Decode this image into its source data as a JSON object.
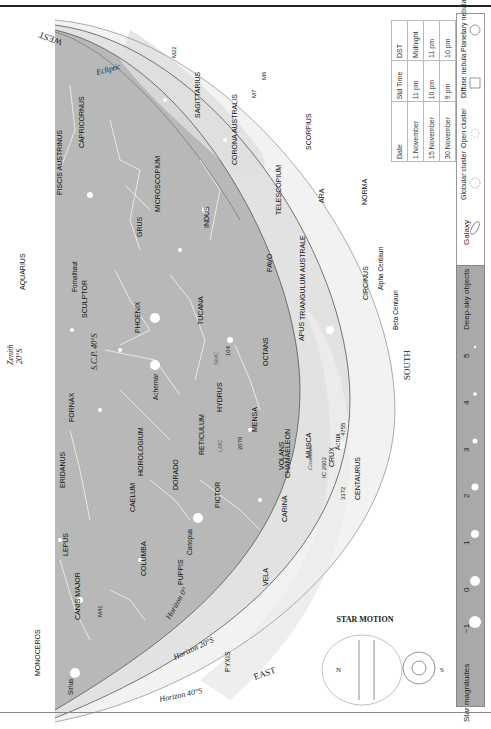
{
  "page": {
    "header": "",
    "orientation": "rotated-90"
  },
  "chart": {
    "directions": {
      "west": "WEST",
      "south": "SOUTH",
      "east": "EAST"
    },
    "zenith_label": "Zenith",
    "zenith_lat": "20°S",
    "center_label": "S.C.P. 40°S",
    "ecliptic_label": "Ecliptic",
    "horizons": [
      "Horizon 0°",
      "Horizon 20°S",
      "Horizon 40°S"
    ],
    "constellations": [
      "SAGITTARIUS",
      "CAPRICORNUS",
      "PISCIS AUSTRINUS",
      "AQUARIUS",
      "MICROSCOPIUM",
      "GRUS",
      "INDUS",
      "CORONA AUSTRALIS",
      "SCORPIUS",
      "TELESCOPIUM",
      "ARA",
      "NORMA",
      "PAVO",
      "TRIANGULUM AUSTRALE",
      "CIRCINUS",
      "APUS",
      "OCTANS",
      "TUCANA",
      "PHOENIX",
      "SCULPTOR",
      "FORNAX",
      "ERIDANUS",
      "HOROLOGIUM",
      "RETICULUM",
      "HYDRUS",
      "MENSA",
      "CHAMAELEON",
      "MUSCA",
      "CRUX",
      "CENTAURUS",
      "CAELUM",
      "DORADO",
      "PICTOR",
      "VOLANS",
      "CARINA",
      "COLUMBA",
      "LEPUS",
      "PUPPIS",
      "VELA",
      "CANIS MAJOR",
      "MONOCEROS",
      "PYXIS"
    ],
    "stars": [
      "Fomalhaut",
      "Achernar",
      "Canopus",
      "Sirius",
      "Acrux",
      "Alpha Centauri",
      "Beta Centauri"
    ],
    "deep_sky": [
      "M22",
      "M7",
      "M6",
      "104",
      "SMC",
      "LMC",
      "2070",
      "IC 2602",
      "3372",
      "4755",
      "Coalsack",
      "M41"
    ]
  },
  "dates_table": {
    "headers": [
      "Date",
      "Std Time",
      "DST"
    ],
    "rows": [
      [
        "1 November",
        "11 pm",
        "Midnight"
      ],
      [
        "15 November",
        "10 pm",
        "11 pm"
      ],
      [
        "30 November",
        "9 pm",
        "10 pm"
      ]
    ]
  },
  "star_motion": {
    "title": "STAR MOTION",
    "left": "N",
    "right": "S"
  },
  "legend": {
    "deep_sky_title": "Deep-sky objects",
    "deep_sky_items": [
      "Galaxy",
      "Globular cluster",
      "Open cluster",
      "Diffuse nebula",
      "Planetary nebula"
    ],
    "mag_title": "Star magnitudes",
    "magnitudes": [
      "−1",
      "0",
      "1",
      "2",
      "3",
      "4",
      "5"
    ]
  },
  "colors": {
    "sky": "#b4b4b4",
    "sky_light": "#d6d6d6",
    "milky_way": "#e8e8e8",
    "horizon_line": "#555555",
    "star": "#ffffff",
    "label": "#111111"
  }
}
